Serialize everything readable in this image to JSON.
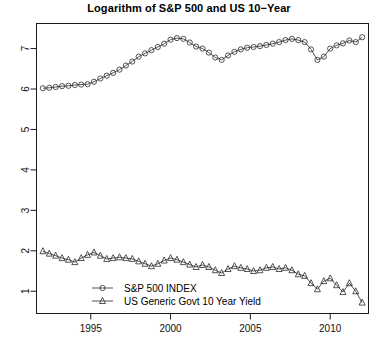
{
  "chart_data": {
    "type": "line",
    "title": "Logarithm of S&P 500 and US 10−Year",
    "xlabel": "",
    "ylabel": "",
    "xlim": [
      1991.6,
      2012.4
    ],
    "ylim": [
      0.45,
      7.62
    ],
    "grid": false,
    "legend_position": "bottom-center",
    "xticks": [
      1995,
      2000,
      2005,
      2010
    ],
    "xtick_labels": [
      "1995",
      "2000",
      "2005",
      "2010"
    ],
    "yticks": [
      1,
      2,
      3,
      4,
      5,
      6,
      7
    ],
    "ytick_labels": [
      "1",
      "2",
      "3",
      "4",
      "5",
      "6",
      "7"
    ],
    "series": [
      {
        "name": "S&P 500 INDEX",
        "marker": "circle",
        "x": [
          1992.0,
          1992.4,
          1992.8,
          1993.2,
          1993.6,
          1994.0,
          1994.4,
          1994.8,
          1995.2,
          1995.6,
          1996.0,
          1996.4,
          1996.8,
          1997.2,
          1997.6,
          1998.0,
          1998.4,
          1998.8,
          1999.2,
          1999.6,
          2000.0,
          2000.4,
          2000.8,
          2001.2,
          2001.6,
          2002.0,
          2002.4,
          2002.8,
          2003.2,
          2003.6,
          2004.0,
          2004.4,
          2004.8,
          2005.2,
          2005.6,
          2006.0,
          2006.4,
          2006.8,
          2007.2,
          2007.6,
          2008.0,
          2008.4,
          2008.8,
          2009.2,
          2009.6,
          2010.0,
          2010.4,
          2010.8,
          2011.2,
          2011.6,
          2012.0
        ],
        "y": [
          6.02,
          6.03,
          6.05,
          6.07,
          6.08,
          6.1,
          6.11,
          6.12,
          6.18,
          6.26,
          6.33,
          6.4,
          6.48,
          6.58,
          6.68,
          6.8,
          6.88,
          6.96,
          7.04,
          7.12,
          7.22,
          7.26,
          7.24,
          7.15,
          7.05,
          7.0,
          6.9,
          6.78,
          6.72,
          6.83,
          6.92,
          6.98,
          7.02,
          7.04,
          7.06,
          7.09,
          7.12,
          7.16,
          7.21,
          7.24,
          7.21,
          7.16,
          6.98,
          6.72,
          6.8,
          7.0,
          7.08,
          7.13,
          7.2,
          7.16,
          7.28
        ]
      },
      {
        "name": "US Generic Govt 10 Year Yield",
        "marker": "triangle",
        "x": [
          1992.0,
          1992.4,
          1992.8,
          1993.2,
          1993.6,
          1994.0,
          1994.4,
          1994.8,
          1995.2,
          1995.6,
          1996.0,
          1996.4,
          1996.8,
          1997.2,
          1997.6,
          1998.0,
          1998.4,
          1998.8,
          1999.2,
          1999.6,
          2000.0,
          2000.4,
          2000.8,
          2001.2,
          2001.6,
          2002.0,
          2002.4,
          2002.8,
          2003.2,
          2003.6,
          2004.0,
          2004.4,
          2004.8,
          2005.2,
          2005.6,
          2006.0,
          2006.4,
          2006.8,
          2007.2,
          2007.6,
          2008.0,
          2008.4,
          2008.8,
          2009.2,
          2009.6,
          2010.0,
          2010.4,
          2010.8,
          2011.2,
          2011.6,
          2012.0
        ],
        "y": [
          1.99,
          1.93,
          1.88,
          1.82,
          1.78,
          1.72,
          1.82,
          1.9,
          1.96,
          1.88,
          1.8,
          1.82,
          1.84,
          1.82,
          1.8,
          1.74,
          1.68,
          1.62,
          1.68,
          1.76,
          1.82,
          1.78,
          1.72,
          1.66,
          1.6,
          1.65,
          1.6,
          1.52,
          1.45,
          1.55,
          1.62,
          1.58,
          1.55,
          1.5,
          1.52,
          1.58,
          1.6,
          1.55,
          1.58,
          1.52,
          1.42,
          1.38,
          1.2,
          1.05,
          1.25,
          1.32,
          1.15,
          0.98,
          1.2,
          1.0,
          0.72
        ]
      }
    ]
  },
  "legend": {
    "entries": [
      {
        "label": "S&P 500 INDEX",
        "marker": "circle"
      },
      {
        "label": "US Generic Govt 10 Year Yield",
        "marker": "triangle"
      }
    ]
  }
}
